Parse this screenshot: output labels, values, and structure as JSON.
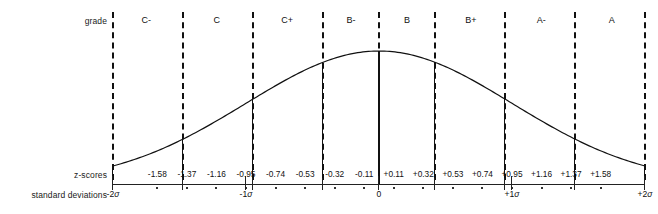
{
  "labels": {
    "grade": "grade",
    "zscores": "z-scores",
    "standard_deviations": "standard deviations"
  },
  "chart_data": {
    "type": "line",
    "title": "",
    "subtitle": "",
    "xlabel": "standard deviations",
    "ylabel": "",
    "grid": false,
    "legend": null,
    "xlim": [
      -2,
      2
    ],
    "ylim": [
      0,
      1
    ],
    "curve": {
      "name": "normal-distribution",
      "formula": "exp(-x^2/2)",
      "x": [
        -2.0,
        -1.8,
        -1.6,
        -1.4,
        -1.2,
        -1.0,
        -0.8,
        -0.6,
        -0.4,
        -0.2,
        0.0,
        0.2,
        0.4,
        0.6,
        0.8,
        1.0,
        1.2,
        1.4,
        1.6,
        1.8,
        2.0
      ],
      "y": [
        0.135,
        0.198,
        0.278,
        0.375,
        0.487,
        0.607,
        0.726,
        0.835,
        0.923,
        0.98,
        1.0,
        0.98,
        0.923,
        0.835,
        0.726,
        0.607,
        0.487,
        0.375,
        0.278,
        0.198,
        0.135
      ]
    },
    "grade_bands": [
      {
        "label": "C-",
        "center": -1.75
      },
      {
        "label": "C",
        "center": -1.22
      },
      {
        "label": "C+",
        "center": -0.69
      },
      {
        "label": "B-",
        "center": -0.21
      },
      {
        "label": "B",
        "center": 0.21
      },
      {
        "label": "B+",
        "center": 0.69
      },
      {
        "label": "A-",
        "center": 1.22
      },
      {
        "label": "A",
        "center": 1.75
      }
    ],
    "boundaries": [
      -2.0,
      -1.47,
      -0.95,
      -0.42,
      0.0,
      0.42,
      0.95,
      1.47,
      2.0
    ],
    "z_scores": [
      "-1.58",
      "-1.37",
      "-1.16",
      "-0.95",
      "-0.74",
      "-0.53",
      "-0.32",
      "-0.11",
      "+0.11",
      "+0.32",
      "+0.53",
      "+0.74",
      "+0.95",
      "+1.16",
      "+1.37",
      "+1.58"
    ],
    "sigma_ticks": [
      {
        "label": "-2σ",
        "value": -2
      },
      {
        "label": "-1σ",
        "value": -1
      },
      {
        "label": "0",
        "value": 0
      },
      {
        "label": "+1σ",
        "value": 1
      },
      {
        "label": "+2σ",
        "value": 2
      }
    ],
    "colors": {
      "line": "#111111",
      "axis": "#222222",
      "text": "#101010",
      "background": "#ffffff"
    }
  }
}
